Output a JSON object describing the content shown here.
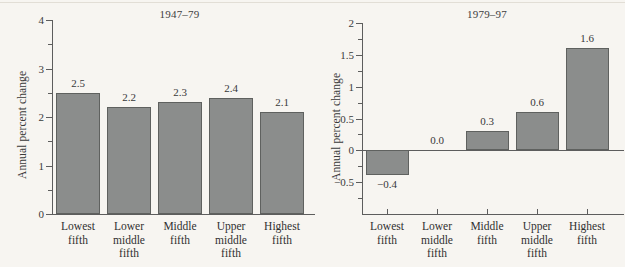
{
  "figure": {
    "background_color": "#f7f5f1",
    "bar_fill_color": "#8b8d8c",
    "bar_edge_color": "#5f615f",
    "axis_color": "#5d5d5d",
    "text_color": "#3a3a3a"
  },
  "panels": [
    {
      "id": "left",
      "title": "1947–79",
      "ylabel": "Annual percent change",
      "ytick_labels": [
        "0",
        "1",
        "2",
        "3",
        "4"
      ],
      "categories": [
        "Lowest\nfifth",
        "Lower\nmiddle\nfifth",
        "Middle\nfifth",
        "Upper\nmiddle\nfifth",
        "Highest\nfifth"
      ],
      "value_labels": [
        "2.5",
        "2.2",
        "2.3",
        "2.4",
        "2.1"
      ]
    },
    {
      "id": "right",
      "title": "1979–97",
      "ylabel": "Annual percent change",
      "ytick_labels": [
        "−0.5",
        "0",
        "0.5",
        "1",
        "1.5",
        "2"
      ],
      "categories": [
        "Lowest\nfifth",
        "Lower\nmiddle\nfifth",
        "Middle\nfifth",
        "Upper\nmiddle\nfifth",
        "Highest\nfifth"
      ],
      "value_labels": [
        "−0.4",
        "0.0",
        "0.3",
        "0.6",
        "1.6"
      ]
    }
  ],
  "chart_data": [
    {
      "type": "bar",
      "title": "1947–79",
      "xlabel": "",
      "ylabel": "Annual percent change",
      "categories": [
        "Lowest fifth",
        "Lower middle fifth",
        "Middle fifth",
        "Upper middle fifth",
        "Highest fifth"
      ],
      "values": [
        2.5,
        2.2,
        2.3,
        2.4,
        2.1
      ],
      "data_labels": [
        "2.5",
        "2.2",
        "2.3",
        "2.4",
        "2.1"
      ],
      "ylim": [
        0,
        4
      ],
      "ytick_major": [
        0,
        1,
        2,
        3,
        4
      ],
      "ytick_minor": [
        0.5,
        1.5,
        2.5,
        3.5
      ],
      "grid": false,
      "legend": null,
      "bar_color": "#8b8d8c"
    },
    {
      "type": "bar",
      "title": "1979–97",
      "xlabel": "",
      "ylabel": "Annual percent change",
      "categories": [
        "Lowest fifth",
        "Lower middle fifth",
        "Middle fifth",
        "Upper middle fifth",
        "Highest fifth"
      ],
      "values": [
        -0.4,
        0.0,
        0.3,
        0.6,
        1.6
      ],
      "data_labels": [
        "−0.4",
        "0.0",
        "0.3",
        "0.6",
        "1.6"
      ],
      "ylim": [
        -1,
        2
      ],
      "ytick_major": [
        -0.5,
        0,
        0.5,
        1,
        1.5,
        2
      ],
      "ytick_minor": [
        -0.75,
        -0.25,
        0.25,
        0.75,
        1.25,
        1.75
      ],
      "grid": false,
      "legend": null,
      "bar_color": "#8b8d8c",
      "baseline": 0
    }
  ]
}
